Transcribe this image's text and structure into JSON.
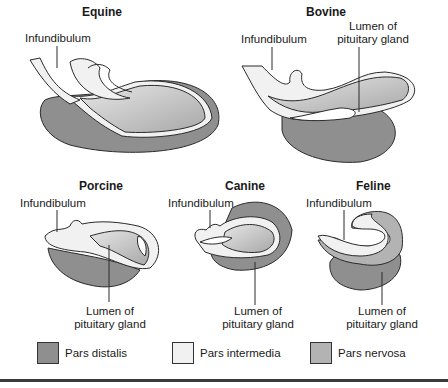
{
  "colors": {
    "pars_distalis": "#8f8f8f",
    "pars_intermedia": "#f1f1f1",
    "pars_nervosa": "#b3b3b3",
    "outline": "#2a2a2a"
  },
  "panels": [
    {
      "title": "Equine",
      "labels": [
        "Infundibulum"
      ]
    },
    {
      "title": "Bovine",
      "labels": [
        "Infundibulum",
        "Lumen of",
        "pituitary gland"
      ]
    },
    {
      "title": "Porcine",
      "labels": [
        "Infundibulum",
        "Lumen of",
        "pituitary gland"
      ]
    },
    {
      "title": "Canine",
      "labels": [
        "Infundibulum",
        "Lumen of",
        "pituitary gland"
      ]
    },
    {
      "title": "Feline",
      "labels": [
        "Infundibulum",
        "Lumen of",
        "pituitary gland"
      ]
    }
  ],
  "legend": [
    {
      "label": "Pars distalis",
      "color": "#8f8f8f"
    },
    {
      "label": "Pars intermedia",
      "color": "#f1f1f1"
    },
    {
      "label": "Pars nervosa",
      "color": "#b3b3b3"
    }
  ]
}
